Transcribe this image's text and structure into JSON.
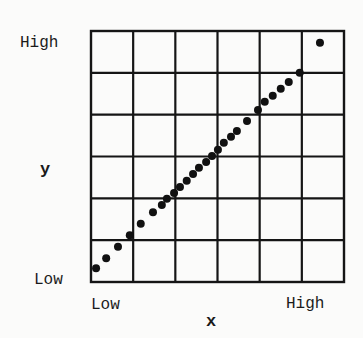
{
  "chart_data": {
    "type": "scatter",
    "title": "",
    "xlabel": "x",
    "ylabel": "y",
    "x_tick_labels": {
      "low": "Low",
      "high": "High"
    },
    "y_tick_labels": {
      "low": "Low",
      "high": "High"
    },
    "xlim": [
      0,
      6
    ],
    "ylim": [
      0,
      6
    ],
    "grid": true,
    "grid_divisions": 6,
    "legend": "none",
    "units_note": "values in grid-cell units from Low (0) to High (6)",
    "series": [
      {
        "name": "points",
        "color": "#111111",
        "x": [
          0.12,
          0.36,
          0.64,
          0.92,
          1.18,
          1.47,
          1.68,
          1.8,
          1.97,
          2.11,
          2.27,
          2.42,
          2.56,
          2.73,
          2.87,
          3.01,
          3.15,
          3.32,
          3.46,
          3.7,
          3.96,
          4.12,
          4.31,
          4.5,
          4.69,
          4.95,
          5.43
        ],
        "y": [
          0.33,
          0.57,
          0.84,
          1.12,
          1.39,
          1.67,
          1.84,
          1.99,
          2.13,
          2.27,
          2.42,
          2.58,
          2.73,
          2.87,
          3.01,
          3.16,
          3.33,
          3.47,
          3.61,
          3.85,
          4.11,
          4.31,
          4.45,
          4.62,
          4.78,
          5.0,
          5.72
        ]
      }
    ]
  }
}
